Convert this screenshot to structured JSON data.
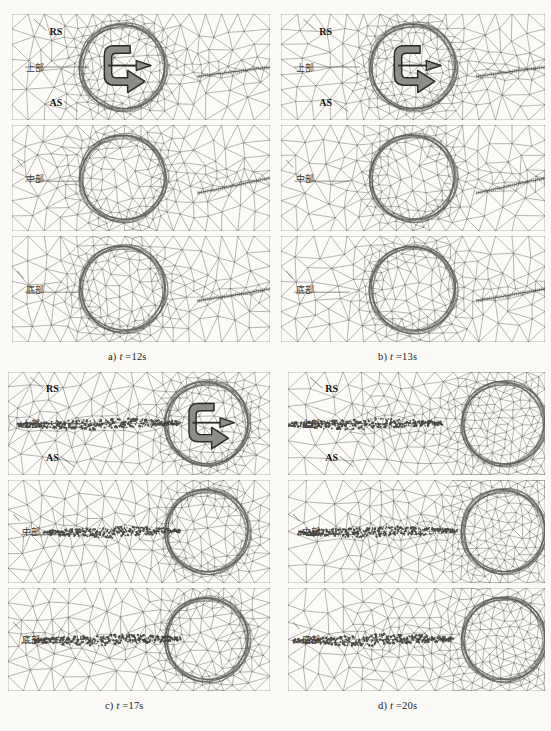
{
  "figure": {
    "type": "fsw-simulation-mesh-series",
    "background_color": "#fbfaf7",
    "mesh_line_color": "#6b6b66",
    "tool_ring_color": "#5a5a57",
    "tracer_color": "#3a3a36",
    "arrow_fill": "#8c8c88",
    "arrow_stroke": "#2a2a28"
  },
  "captions": {
    "a": {
      "prefix": "a)",
      "var": "t",
      "value": " =12s"
    },
    "b": {
      "prefix": "b)",
      "var": "t",
      "value": " =13s"
    },
    "c": {
      "prefix": "c)",
      "var": "t",
      "value": " =17s"
    },
    "d": {
      "prefix": "d)",
      "var": "t",
      "value": " =20s"
    }
  },
  "labels": {
    "rs": "RS",
    "as": "AS",
    "upper": "上部",
    "middle": "中部",
    "bottom": "底部"
  },
  "icons": {
    "rotation_arrow": "clockwise-rotation-arrow-icon",
    "travel_arrow": "travel-direction-arrow-icon"
  },
  "panels": [
    {
      "id": "a",
      "time_label": "t =12s",
      "time_seconds": 12,
      "tool_rotation_symbol": true,
      "tool_x_fraction": 0.43,
      "seam_progress_fraction": 0.0,
      "interface_line": "dotted-unwelded-joint",
      "subpanels": [
        {
          "depth": "upper",
          "label": "上部",
          "tool_cx": 0.43,
          "seam_start": 0.72,
          "seam_end": 1.0
        },
        {
          "depth": "middle",
          "label": "中部",
          "tool_cx": 0.43,
          "seam_start": 0.72,
          "seam_end": 1.0
        },
        {
          "depth": "bottom",
          "label": "底部",
          "tool_cx": 0.43,
          "seam_start": 0.72,
          "seam_end": 1.0
        }
      ]
    },
    {
      "id": "b",
      "time_label": "t =13s",
      "time_seconds": 13,
      "tool_rotation_symbol": true,
      "tool_x_fraction": 0.5,
      "seam_progress_fraction": 0.1,
      "interface_line": "dotted-unwelded-joint",
      "subpanels": [
        {
          "depth": "upper",
          "label": "上部",
          "tool_cx": 0.5,
          "seam_start": 0.74,
          "seam_end": 1.0
        },
        {
          "depth": "middle",
          "label": "中部",
          "tool_cx": 0.5,
          "seam_start": 0.74,
          "seam_end": 1.0
        },
        {
          "depth": "bottom",
          "label": "底部",
          "tool_cx": 0.5,
          "seam_start": 0.74,
          "seam_end": 1.0
        }
      ]
    },
    {
      "id": "c",
      "time_label": "t =17s",
      "time_seconds": 17,
      "tool_rotation_symbol": true,
      "tool_x_fraction": 0.76,
      "seam_progress_fraction": 0.62,
      "interface_line": "welded-tracer-trail",
      "subpanels": [
        {
          "depth": "upper",
          "label": "上部",
          "tool_cx": 0.76,
          "seam_start": 0.04,
          "seam_end": 0.66
        },
        {
          "depth": "middle",
          "label": "中部",
          "tool_cx": 0.76,
          "seam_start": 0.14,
          "seam_end": 0.66
        },
        {
          "depth": "bottom",
          "label": "底部",
          "tool_cx": 0.76,
          "seam_start": 0.1,
          "seam_end": 0.66
        }
      ]
    },
    {
      "id": "d",
      "time_label": "t =20s",
      "time_seconds": 20,
      "tool_rotation_symbol": false,
      "tool_x_fraction": 0.84,
      "seam_progress_fraction": 0.8,
      "interface_line": "welded-tracer-trail",
      "subpanels": [
        {
          "depth": "upper",
          "label": "上部",
          "tool_cx": 0.84,
          "seam_start": 0.0,
          "seam_end": 0.6
        },
        {
          "depth": "middle",
          "label": "中部",
          "tool_cx": 0.84,
          "seam_start": 0.04,
          "seam_end": 0.66
        },
        {
          "depth": "bottom",
          "label": "底部",
          "tool_cx": 0.84,
          "seam_start": 0.02,
          "seam_end": 0.64
        }
      ]
    }
  ]
}
